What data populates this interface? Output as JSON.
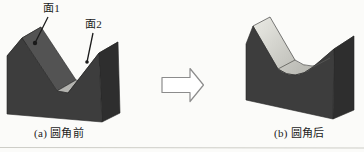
{
  "diagram": {
    "left_panel": {
      "caption": "(a) 圆角前",
      "face1_label": "面1",
      "face2_label": "面2"
    },
    "right_panel": {
      "caption": "(b) 圆角后"
    }
  },
  "colors": {
    "background": "#fbfbf9",
    "front_face": "#3d3d3d",
    "face1": "#535353",
    "face2": "#4a4a4a",
    "side_face": "#2e2e2e",
    "top_slope": "#6f6f6f",
    "groove_floor": "#b3b3af",
    "groove_light": "#e9e9e3",
    "groove_shadow": "#aeaea8",
    "arrow_fill": "#ffffff",
    "arrow_stroke": "#8c8c8c",
    "leader": "#1a1a1a",
    "edge": "#262626",
    "rule_line": "#cdcdc7",
    "text": "#1c1c1c"
  }
}
